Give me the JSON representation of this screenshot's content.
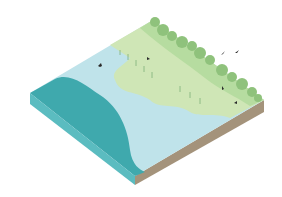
{
  "illustration": {
    "subject": "isometric coastal wetland landscape block",
    "colors": {
      "background": "#ffffff",
      "deep_water": "#3fa9ad",
      "shallow_water": "#bfe3ea",
      "marsh": "#cfe6b6",
      "upland": "#b6dca0",
      "trees": "#8fc27c",
      "soil_side": "#a4937b",
      "water_side": "#5bbcc0",
      "birds": "#2a2a2a"
    },
    "bird_count": 6
  }
}
